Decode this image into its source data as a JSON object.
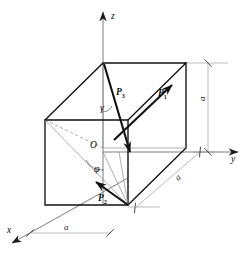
{
  "figure": {
    "type": "geometry-diagram",
    "background_color": "#ffffff",
    "line_color": "#111111",
    "thin_line_color": "#8a8a8a",
    "dashed_line_color": "#8a8a8a"
  },
  "axes": [
    {
      "id": "z",
      "label": "z",
      "direction": "up",
      "label_x": 111,
      "label_y": 19
    },
    {
      "id": "y",
      "label": "y",
      "direction": "right",
      "label_x": 231,
      "label_y": 162
    },
    {
      "id": "x",
      "label": "x",
      "direction": "down-left",
      "label_x": 7,
      "label_y": 233
    }
  ],
  "origin": {
    "label": "O",
    "label_x": 90,
    "label_y": 148
  },
  "angles": [
    {
      "id": "gamma",
      "label": "γ",
      "label_x": 100,
      "label_y": 111,
      "description": "angle between z-axis and P3"
    },
    {
      "id": "phi",
      "label": "φ",
      "label_x": 94,
      "label_y": 172,
      "description": "azimuthal angle in base plane"
    }
  ],
  "vectors": [
    {
      "id": "P1",
      "name": "P",
      "subscript": "1",
      "label_x": 158,
      "label_y": 96,
      "description": "along the top rear-right edge, pointing up-right"
    },
    {
      "id": "P3",
      "name": "P",
      "subscript": "3",
      "label_x": 116,
      "label_y": 95,
      "description": "from top vertex down to front face, near vertical"
    },
    {
      "id": "P2",
      "name": "P",
      "subscript": "2",
      "label_x": 98,
      "label_y": 201,
      "description": "in the base plane, pointing left from the corner"
    }
  ],
  "dimensions": [
    {
      "id": "a-height",
      "label": "a",
      "label_x": 205,
      "label_y": 101,
      "orientation": "vertical",
      "description": "cube height along z"
    },
    {
      "id": "a-depth",
      "label": "a",
      "label_x": 178,
      "label_y": 181,
      "orientation": "diagonal",
      "description": "cube depth along y"
    },
    {
      "id": "a-width",
      "label": "a",
      "label_x": 64,
      "label_y": 230,
      "orientation": "horizontal",
      "description": "cube width along x"
    }
  ]
}
